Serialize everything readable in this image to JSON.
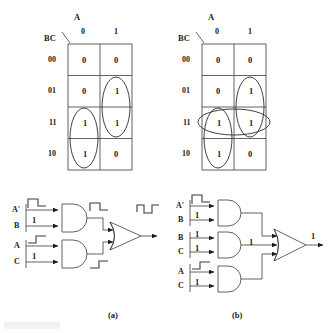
{
  "figure": {
    "caption_a": "(a)",
    "caption_b": "(b)"
  },
  "kmaps": [
    {
      "id": "kmap-a",
      "col_var": "A",
      "row_var": "BC",
      "col_headers": [
        "0",
        "1"
      ],
      "row_headers": [
        "00",
        "01",
        "11",
        "10"
      ],
      "cells": [
        [
          "0",
          "0"
        ],
        [
          "0",
          "1"
        ],
        [
          "1",
          "1"
        ],
        [
          "1",
          "0"
        ]
      ],
      "groups": [
        {
          "name": "group-bc-prime",
          "shape": "ellipse",
          "col": 0,
          "rows": [
            2,
            3
          ]
        },
        {
          "name": "group-a-b",
          "shape": "ellipse",
          "col": 1,
          "rows": [
            1,
            2
          ]
        }
      ]
    },
    {
      "id": "kmap-b",
      "col_var": "A",
      "row_var": "BC",
      "col_headers": [
        "0",
        "1"
      ],
      "row_headers": [
        "00",
        "01",
        "11",
        "10"
      ],
      "cells": [
        [
          "0",
          "0"
        ],
        [
          "0",
          "1"
        ],
        [
          "1",
          "1"
        ],
        [
          "1",
          "0"
        ]
      ],
      "groups": [
        {
          "name": "group-bc-prime",
          "shape": "ellipse",
          "col": 0,
          "rows": [
            2,
            3
          ]
        },
        {
          "name": "group-a-b",
          "shape": "ellipse",
          "col": 1,
          "rows": [
            1,
            2
          ]
        },
        {
          "name": "group-bc-consensus",
          "shape": "ellipse-horizontal",
          "row": 2,
          "cols": [
            0,
            1
          ]
        }
      ]
    }
  ],
  "circuits": [
    {
      "id": "circuit-a",
      "caption": "(a)",
      "gates": [
        {
          "name": "and-gate-top",
          "type": "AND",
          "inputs": [
            {
              "label": "A'",
              "annotation": "falling-edge",
              "value": ""
            },
            {
              "label": "B",
              "annotation": "value",
              "value": "1"
            }
          ],
          "output_annotation": "falling-edge",
          "output_value": ""
        },
        {
          "name": "and-gate-bottom",
          "type": "AND",
          "inputs": [
            {
              "label": "A",
              "annotation": "rising-edge",
              "value": ""
            },
            {
              "label": "C",
              "annotation": "value",
              "value": "1"
            }
          ],
          "output_annotation": "rising-edge",
          "output_value": ""
        },
        {
          "name": "or-gate-output",
          "type": "OR",
          "inputs": [],
          "output_annotation": "glitch-pulse",
          "output_value": ""
        }
      ]
    },
    {
      "id": "circuit-b",
      "caption": "(b)",
      "gates": [
        {
          "name": "and-gate-top",
          "type": "AND",
          "inputs": [
            {
              "label": "A'",
              "annotation": "falling-edge",
              "value": ""
            },
            {
              "label": "B",
              "annotation": "value",
              "value": "1"
            }
          ],
          "output_annotation": "none",
          "output_value": ""
        },
        {
          "name": "and-gate-middle",
          "type": "AND",
          "inputs": [
            {
              "label": "B",
              "annotation": "value",
              "value": "1"
            },
            {
              "label": "C",
              "annotation": "value",
              "value": "1"
            }
          ],
          "output_annotation": "value",
          "output_value": "1"
        },
        {
          "name": "and-gate-bottom",
          "type": "AND",
          "inputs": [
            {
              "label": "A",
              "annotation": "rising-edge",
              "value": ""
            },
            {
              "label": "C",
              "annotation": "value",
              "value": "1"
            }
          ],
          "output_annotation": "none",
          "output_value": ""
        },
        {
          "name": "or-gate-output",
          "type": "OR",
          "inputs": [],
          "output_annotation": "value",
          "output_value": "1"
        }
      ]
    }
  ]
}
